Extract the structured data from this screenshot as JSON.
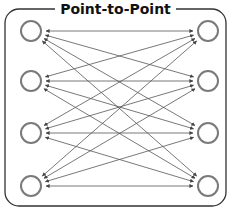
{
  "title": "Point-to-Point",
  "colors": {
    "frame": "#333333",
    "node": "#7a7a7a",
    "edge": "#555555",
    "background": "#ffffff"
  },
  "frame": {
    "x": 5,
    "y": 9,
    "width": 221,
    "height": 197,
    "radius": 14
  },
  "nodes": {
    "radius": 10,
    "left": [
      {
        "id": "L1",
        "x": 31,
        "y": 31
      },
      {
        "id": "L2",
        "x": 31,
        "y": 81
      },
      {
        "id": "L3",
        "x": 31,
        "y": 133
      },
      {
        "id": "L4",
        "x": 31,
        "y": 186
      }
    ],
    "right": [
      {
        "id": "R1",
        "x": 208,
        "y": 31
      },
      {
        "id": "R2",
        "x": 208,
        "y": 81
      },
      {
        "id": "R3",
        "x": 208,
        "y": 133
      },
      {
        "id": "R4",
        "x": 208,
        "y": 186
      }
    ]
  },
  "edges_description": "Every left node connected to every right node with a bidirectional arrow (16 edges)"
}
